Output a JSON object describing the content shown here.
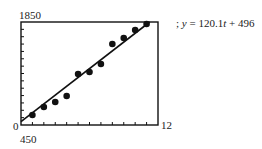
{
  "chart_data": {
    "type": "scatter",
    "title": "",
    "xlabel": "",
    "ylabel": "",
    "xlim": [
      0,
      12
    ],
    "ylim": [
      450,
      1850
    ],
    "tick_labels": {
      "x_min": "0",
      "x_max": "12",
      "y_min": "450",
      "y_max": "1850"
    },
    "x_ticks": 12,
    "y_ticks": 14,
    "grid": false,
    "legend": null,
    "series": [
      {
        "name": "data",
        "x": [
          1,
          2,
          3,
          4,
          5,
          6,
          7,
          8,
          9,
          10,
          11
        ],
        "y": [
          586,
          695,
          763,
          844,
          1143,
          1170,
          1279,
          1551,
          1632,
          1741,
          1823
        ]
      }
    ],
    "regression_line": {
      "slope": 120.1,
      "intercept": 496
    },
    "annotation": "; y = 120.1t + 496"
  },
  "labels": {
    "y_max": "1850",
    "y_min": "450",
    "x_min": "0",
    "x_max": "12",
    "eq_prefix": "; ",
    "eq_y": "y",
    "eq_mid": " = 120.1",
    "eq_t": "t",
    "eq_end": " + 496"
  }
}
